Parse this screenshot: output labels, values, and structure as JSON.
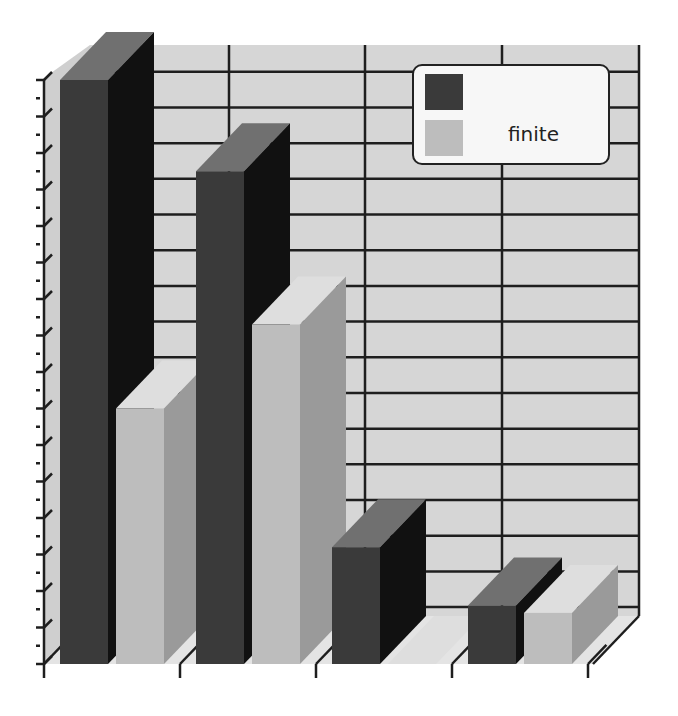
{
  "chart_data": {
    "type": "bar",
    "style": "3d-clustered-column",
    "title": "",
    "xlabel": "",
    "ylabel": "",
    "categories": [
      "",
      "",
      "",
      ""
    ],
    "series": [
      {
        "name": "",
        "color": "#3a3a3a",
        "values": [
          16,
          13.5,
          3.2,
          1.6
        ]
      },
      {
        "name": "finite",
        "color": "#bdbdbd",
        "values": [
          7,
          9.3,
          0,
          1.4
        ]
      }
    ],
    "ylim": [
      0,
      16
    ],
    "y_tick_labels_visible": false,
    "grid": true,
    "legend_position": "top-right"
  },
  "legend": {
    "items": [
      {
        "label": "",
        "color": "#3a3a3a"
      },
      {
        "label": "finite",
        "color": "#bdbdbd"
      }
    ]
  },
  "colors": {
    "wall": "#d6d6d6",
    "floor": "#e4e4e4",
    "gridline": "#1e1e1e",
    "dark_front": "#3a3a3a",
    "dark_side": "#111111",
    "dark_top": "#707070",
    "light_front": "#bdbdbd",
    "light_side": "#9a9a9a",
    "light_top": "#dedede"
  }
}
